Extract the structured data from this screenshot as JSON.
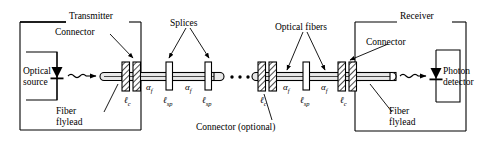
{
  "diagram": {
    "type": "block-schematic",
    "boxes": {
      "transmitter": {
        "label": "Transmitter"
      },
      "receiver": {
        "label": "Receiver"
      },
      "optical_source": {
        "label_line1": "Optical",
        "label_line2": "source"
      },
      "photon_detector": {
        "label_line1": "Photon",
        "label_line2": "detector"
      }
    },
    "callouts": {
      "connector_tx": "Connector",
      "connector_rx": "Connector",
      "splices": "Splices",
      "optical_fibers": "Optical fibers",
      "connector_optional": "Connector (optional)",
      "fiber_flylead_tx_line1": "Fiber",
      "fiber_flylead_tx_line2": "flylead",
      "fiber_flylead_rx_line1": "Fiber",
      "fiber_flylead_rx_line2": "flylead"
    },
    "symbols": {
      "loss_connector": "ℓ",
      "loss_connector_sub": "c",
      "loss_splice": "ℓ",
      "loss_splice_sub": "sp",
      "attenuation_fiber": "α",
      "attenuation_fiber_sub": "f",
      "ellipsis": "• • •"
    },
    "element_labels": {
      "lc_1": "ℓ",
      "lc_1_sub": "c",
      "lsp_1": "ℓ",
      "lsp_1_sub": "sp",
      "lsp_2": "ℓ",
      "lsp_2_sub": "sp",
      "lc_2": "ℓ",
      "lc_2_sub": "c",
      "lsp_3": "ℓ",
      "lsp_3_sub": "sp",
      "lc_3": "ℓ",
      "lc_3_sub": "c",
      "af_1": "α",
      "af_1_sub": "f",
      "af_2": "α",
      "af_2_sub": "f",
      "af_3": "α",
      "af_3_sub": "f",
      "af_4": "α",
      "af_4_sub": "f"
    },
    "colors": {
      "stroke": "#000000",
      "background": "#ffffff",
      "fiber_fill": "#e8e8e8",
      "component_fill": "#ffffff"
    }
  }
}
